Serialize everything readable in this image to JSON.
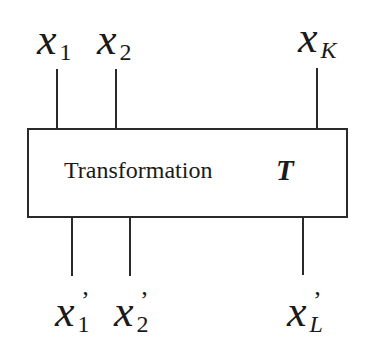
{
  "diagram": {
    "box": {
      "label": "Transformation",
      "symbol": "T"
    },
    "inputs": [
      {
        "base": "x",
        "sub": "1",
        "prime": ""
      },
      {
        "base": "x",
        "sub": "2",
        "prime": ""
      },
      {
        "base": "x",
        "sub": "K",
        "prime": ""
      }
    ],
    "outputs": [
      {
        "base": "x",
        "sub": "1",
        "prime": "’"
      },
      {
        "base": "x",
        "sub": "2",
        "prime": "’"
      },
      {
        "base": "x",
        "sub": "L",
        "prime": "’"
      }
    ],
    "colors": {
      "line": "#2a2a2a",
      "text": "#1a1a1a",
      "background": "#ffffff"
    }
  }
}
